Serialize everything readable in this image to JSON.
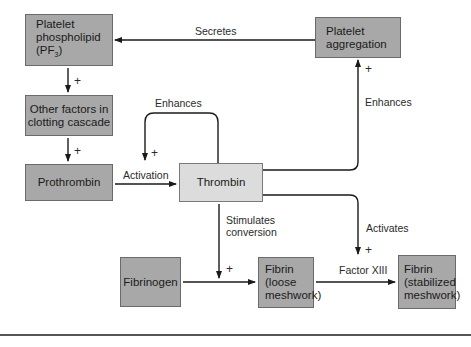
{
  "nodes": {
    "platelet_phospholipid": {
      "label_line1": "Platelet",
      "label_line2": "phospholipid",
      "label_line3": "(PF",
      "label_sub": "3",
      "label_close": ")"
    },
    "other_factors": {
      "label": "Other factors in\nclotting cascade"
    },
    "prothrombin": {
      "label": "Prothrombin"
    },
    "thrombin": {
      "label": "Thrombin"
    },
    "platelet_aggregation": {
      "label": "Platelet\naggregation"
    },
    "fibrinogen": {
      "label": "Fibrinogen"
    },
    "fibrin_loose": {
      "label": "Fibrin\n(loose\nmeshwork)"
    },
    "fibrin_stabilized": {
      "label": "Fibrin\n(stabilized\nmeshwork)"
    }
  },
  "edges": {
    "secretes": "Secretes",
    "enhances_loop": "Enhances",
    "enhances_aggregation": "Enhances",
    "activation": "Activation",
    "stimulates_conversion": "Stimulates\nconversion",
    "activates": "Activates",
    "factor_xiii": "Factor XIII"
  },
  "signs": {
    "plus": "+"
  },
  "colors": {
    "dark_box": "#a8a8a8",
    "light_box": "#dcdcdc",
    "line": "#1a1a1a"
  }
}
